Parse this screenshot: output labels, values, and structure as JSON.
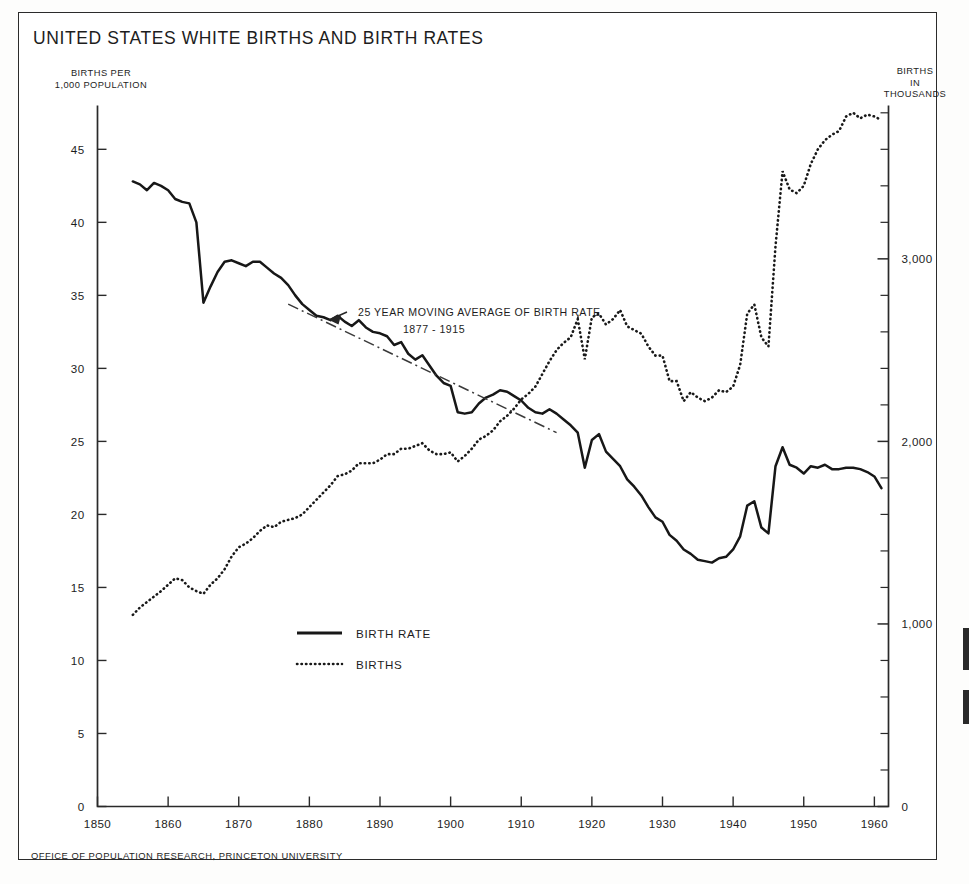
{
  "document": {
    "title": "UNITED STATES  WHITE BIRTHS AND BIRTH RATES",
    "footer": "OFFICE OF POPULATION RESEARCH, PRINCETON UNIVERSITY"
  },
  "axis_labels": {
    "left_line1": "BIRTHS PER",
    "left_line2": "1,000 POPULATION",
    "right_line1": "BIRTHS",
    "right_line2": "IN",
    "right_line3": "THOUSANDS"
  },
  "legend": {
    "items": [
      {
        "label": "BIRTH RATE",
        "style": "solid",
        "series": "birth_rate"
      },
      {
        "label": "BIRTHS",
        "style": "dotted",
        "series": "births"
      }
    ]
  },
  "annotation": {
    "line1": "25 YEAR MOVING AVERAGE OF BIRTH RATE",
    "line2": "1877 - 1915"
  },
  "chart_data": {
    "type": "line",
    "title": "UNITED STATES  WHITE BIRTHS AND BIRTH RATES",
    "xlabel": "",
    "ylabel": "BIRTHS PER 1,000 POPULATION",
    "y2label": "BIRTHS IN THOUSANDS",
    "grid": false,
    "legend_position": "center-left-inside",
    "xlim": [
      1850,
      1962
    ],
    "xticks": [
      1850,
      1860,
      1870,
      1880,
      1890,
      1900,
      1910,
      1920,
      1930,
      1940,
      1950,
      1960
    ],
    "xticklabels": [
      "1850",
      "1860",
      "1870",
      "1880",
      "1890",
      "1900",
      "1910",
      "1920",
      "1930",
      "1940",
      "1950",
      "1960"
    ],
    "ylim": [
      0,
      48
    ],
    "yticks": [
      0,
      5,
      10,
      15,
      20,
      25,
      30,
      35,
      40,
      45
    ],
    "yticklabels": [
      "0",
      "5",
      "10",
      "15",
      "20",
      "25",
      "30",
      "35",
      "40",
      "45"
    ],
    "y2lim": [
      0,
      3840
    ],
    "y2ticks": [
      0,
      1000,
      2000,
      3000
    ],
    "y2ticklabels": [
      "0",
      "1,000",
      "2,000",
      "3,000"
    ],
    "y2minortickstep": 200,
    "series": [
      {
        "name": "BIRTH RATE",
        "axis": "left",
        "style": "solid",
        "units": "births per 1,000 population",
        "x": [
          1855,
          1856,
          1857,
          1858,
          1859,
          1860,
          1861,
          1862,
          1863,
          1864,
          1865,
          1866,
          1867,
          1868,
          1869,
          1870,
          1871,
          1872,
          1873,
          1874,
          1875,
          1876,
          1877,
          1878,
          1879,
          1880,
          1881,
          1882,
          1883,
          1884,
          1885,
          1886,
          1887,
          1888,
          1889,
          1890,
          1891,
          1892,
          1893,
          1894,
          1895,
          1896,
          1897,
          1898,
          1899,
          1900,
          1901,
          1902,
          1903,
          1904,
          1905,
          1906,
          1907,
          1908,
          1909,
          1910,
          1911,
          1912,
          1913,
          1914,
          1915,
          1916,
          1917,
          1918,
          1919,
          1920,
          1921,
          1922,
          1923,
          1924,
          1925,
          1926,
          1927,
          1928,
          1929,
          1930,
          1931,
          1932,
          1933,
          1934,
          1935,
          1936,
          1937,
          1938,
          1939,
          1940,
          1941,
          1942,
          1943,
          1944,
          1945,
          1946,
          1947,
          1948,
          1949,
          1950,
          1951,
          1952,
          1953,
          1954,
          1955,
          1956,
          1957,
          1958,
          1959,
          1960,
          1961
        ],
        "y": [
          42.8,
          42.6,
          42.2,
          42.7,
          42.5,
          42.2,
          41.6,
          41.4,
          41.3,
          40.0,
          34.5,
          35.6,
          36.6,
          37.3,
          37.4,
          37.2,
          37.0,
          37.3,
          37.3,
          36.9,
          36.5,
          36.2,
          35.7,
          35.0,
          34.4,
          34.0,
          33.6,
          33.5,
          33.3,
          33.6,
          33.2,
          32.9,
          33.3,
          32.8,
          32.5,
          32.4,
          32.2,
          31.6,
          31.8,
          31.0,
          30.6,
          30.9,
          30.2,
          29.5,
          29.0,
          28.8,
          27.0,
          26.9,
          27.0,
          27.6,
          28.0,
          28.2,
          28.5,
          28.4,
          28.1,
          27.8,
          27.3,
          27.0,
          26.9,
          27.2,
          26.9,
          26.5,
          26.1,
          25.6,
          23.2,
          25.1,
          25.5,
          24.3,
          23.8,
          23.3,
          22.4,
          21.9,
          21.3,
          20.5,
          19.8,
          19.5,
          18.6,
          18.2,
          17.6,
          17.3,
          16.9,
          16.8,
          16.7,
          17.0,
          17.1,
          17.6,
          18.5,
          20.6,
          20.9,
          19.1,
          18.7,
          23.3,
          24.6,
          23.4,
          23.2,
          22.8,
          23.3,
          23.2,
          23.4,
          23.1,
          23.1,
          23.2,
          23.2,
          23.1,
          22.9,
          22.6,
          21.8
        ]
      },
      {
        "name": "BIRTHS",
        "axis": "right",
        "style": "dotted",
        "units": "thousands of births",
        "x": [
          1855,
          1856,
          1857,
          1858,
          1859,
          1860,
          1861,
          1862,
          1863,
          1864,
          1865,
          1866,
          1867,
          1868,
          1869,
          1870,
          1871,
          1872,
          1873,
          1874,
          1875,
          1876,
          1877,
          1878,
          1879,
          1880,
          1881,
          1882,
          1883,
          1884,
          1885,
          1886,
          1887,
          1888,
          1889,
          1890,
          1891,
          1892,
          1893,
          1894,
          1895,
          1896,
          1897,
          1898,
          1899,
          1900,
          1901,
          1902,
          1903,
          1904,
          1905,
          1906,
          1907,
          1908,
          1909,
          1910,
          1911,
          1912,
          1913,
          1914,
          1915,
          1916,
          1917,
          1918,
          1919,
          1920,
          1921,
          1922,
          1923,
          1924,
          1925,
          1926,
          1927,
          1928,
          1929,
          1930,
          1931,
          1932,
          1933,
          1934,
          1935,
          1936,
          1937,
          1938,
          1939,
          1940,
          1941,
          1942,
          1943,
          1944,
          1945,
          1946,
          1947,
          1948,
          1949,
          1950,
          1951,
          1952,
          1953,
          1954,
          1955,
          1956,
          1957,
          1958,
          1959,
          1960,
          1961
        ],
        "y": [
          1050,
          1090,
          1120,
          1150,
          1180,
          1215,
          1250,
          1240,
          1200,
          1180,
          1165,
          1215,
          1250,
          1300,
          1370,
          1420,
          1440,
          1470,
          1510,
          1540,
          1530,
          1560,
          1570,
          1580,
          1600,
          1640,
          1680,
          1720,
          1760,
          1810,
          1820,
          1840,
          1880,
          1880,
          1880,
          1900,
          1930,
          1930,
          1960,
          1960,
          1975,
          1990,
          1950,
          1930,
          1930,
          1940,
          1890,
          1920,
          1960,
          2010,
          2030,
          2060,
          2110,
          2140,
          2180,
          2230,
          2260,
          2300,
          2370,
          2440,
          2500,
          2540,
          2570,
          2670,
          2450,
          2680,
          2700,
          2640,
          2670,
          2720,
          2630,
          2610,
          2590,
          2520,
          2470,
          2470,
          2330,
          2330,
          2220,
          2270,
          2240,
          2220,
          2240,
          2280,
          2270,
          2300,
          2420,
          2700,
          2750,
          2570,
          2520,
          3070,
          3480,
          3380,
          3360,
          3400,
          3520,
          3600,
          3650,
          3680,
          3700,
          3780,
          3800,
          3770,
          3790,
          3780,
          3760
        ]
      },
      {
        "name": "25 YEAR MOVING AVERAGE OF BIRTH RATE",
        "axis": "left",
        "style": "dash-dot",
        "period": "1877 - 1915",
        "x": [
          1877,
          1915
        ],
        "y": [
          34.4,
          25.6
        ]
      }
    ]
  }
}
